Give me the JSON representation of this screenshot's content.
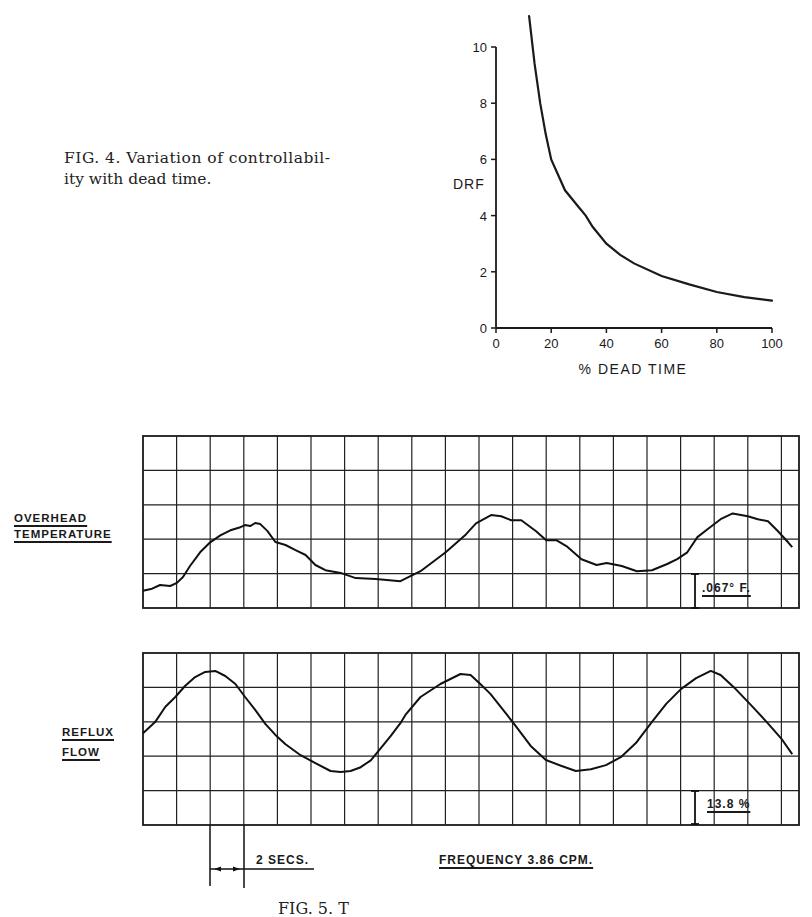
{
  "figure4": {
    "caption_line1": "FIG. 4.  Variation of controllabil-",
    "caption_line2": "ity with dead time."
  },
  "chart_data": [
    {
      "type": "line",
      "title": "FIG. 4. Variation of controllability with dead time.",
      "xlabel": "% DEAD TIME",
      "ylabel": "DRF",
      "xlim": [
        0,
        100
      ],
      "ylim": [
        0,
        10
      ],
      "xticks": [
        "0",
        "20",
        "40",
        "60",
        "80",
        "100"
      ],
      "yticks": [
        "0",
        "2",
        "4",
        "6",
        "8",
        "10"
      ],
      "grid": false,
      "series": [
        {
          "name": "DRF vs dead time",
          "x": [
            12,
            14,
            16,
            18,
            20,
            25,
            30,
            32.5,
            35,
            40,
            45,
            50,
            60,
            70,
            80,
            90,
            100
          ],
          "y": [
            11.1,
            9.4,
            8.0,
            6.9,
            6.0,
            4.9,
            4.3,
            4.0,
            3.6,
            3.0,
            2.6,
            2.3,
            1.85,
            1.55,
            1.28,
            1.1,
            0.97
          ]
        }
      ]
    },
    {
      "type": "line",
      "title": "Recorder traces (FIG. 5)",
      "grid": true,
      "grid_columns": 19.5,
      "grid_rows": 5,
      "time_per_division": "2 SECS.",
      "frequency_label": "FREQUENCY  3.86 CPM.",
      "series": [
        {
          "name": "OVERHEAD TEMPERATURE",
          "scale_label": ".067° F.",
          "scale_per_division": ".067° F.",
          "x_div": [
            0,
            0.27,
            0.51,
            0.81,
            1.01,
            1.19,
            1.4,
            1.7,
            2.0,
            2.3,
            2.6,
            2.9,
            3.04,
            3.19,
            3.34,
            3.49,
            3.7,
            3.94,
            4.24,
            4.54,
            4.84,
            5.13,
            5.43,
            5.88,
            6.33,
            6.93,
            7.66,
            8.26,
            9.01,
            9.61,
            9.91,
            10.36,
            10.66,
            10.96,
            11.26,
            11.7,
            12.0,
            12.3,
            12.6,
            13.05,
            13.5,
            13.8,
            14.25,
            14.7,
            15.15,
            15.6,
            15.9,
            16.2,
            16.5,
            16.8,
            17.19,
            17.55,
            18.0,
            18.3,
            18.6,
            18.9,
            19.2,
            19.32
          ],
          "y_div": [
            0.5,
            0.56,
            0.67,
            0.64,
            0.73,
            0.9,
            1.22,
            1.62,
            1.91,
            2.11,
            2.26,
            2.35,
            2.41,
            2.38,
            2.47,
            2.44,
            2.24,
            1.92,
            1.83,
            1.68,
            1.54,
            1.25,
            1.1,
            1.02,
            0.87,
            0.84,
            0.78,
            1.07,
            1.62,
            2.14,
            2.46,
            2.7,
            2.67,
            2.55,
            2.55,
            2.23,
            1.97,
            1.97,
            1.8,
            1.42,
            1.25,
            1.31,
            1.22,
            1.07,
            1.1,
            1.28,
            1.42,
            1.62,
            2.06,
            2.29,
            2.58,
            2.75,
            2.67,
            2.58,
            2.52,
            2.23,
            1.91,
            1.77
          ]
        },
        {
          "name": "REFLUX FLOW",
          "scale_label": "13.8 %",
          "scale_per_division": "13.8 %",
          "x_div": [
            0,
            0.36,
            0.66,
            0.96,
            1.25,
            1.55,
            1.85,
            2.15,
            2.45,
            2.75,
            3.04,
            3.34,
            3.64,
            3.94,
            4.24,
            4.69,
            5.13,
            5.58,
            5.88,
            6.18,
            6.48,
            6.78,
            7.07,
            7.37,
            7.66,
            7.81,
            8.26,
            8.85,
            9.45,
            9.75,
            10.04,
            10.34,
            10.79,
            11.09,
            11.54,
            11.99,
            12.44,
            12.88,
            13.33,
            13.78,
            14.22,
            14.67,
            15.12,
            15.57,
            16.01,
            16.46,
            16.9,
            17.19,
            17.64,
            18.09,
            18.54,
            18.99,
            19.32
          ],
          "y_div": [
            2.67,
            2.99,
            3.43,
            3.72,
            4.04,
            4.3,
            4.45,
            4.48,
            4.33,
            4.1,
            3.72,
            3.35,
            2.94,
            2.62,
            2.35,
            2.03,
            1.8,
            1.57,
            1.54,
            1.57,
            1.68,
            1.88,
            2.23,
            2.58,
            2.96,
            3.2,
            3.72,
            4.1,
            4.39,
            4.36,
            4.1,
            3.81,
            3.26,
            2.88,
            2.3,
            1.89,
            1.72,
            1.57,
            1.62,
            1.74,
            1.97,
            2.38,
            2.96,
            3.52,
            3.95,
            4.27,
            4.48,
            4.36,
            3.95,
            3.49,
            3.02,
            2.52,
            2.06
          ]
        }
      ]
    }
  ],
  "figure5": {
    "row1_label_line1": "OVERHEAD",
    "row1_label_line2": "TEMPERATURE",
    "row2_label_line1": "REFLUX",
    "row2_label_line2": "FLOW",
    "scale1": ".067° F.",
    "scale2": "13.8 %",
    "time_marker": "2 SECS.",
    "frequency": "FREQUENCY  3.86 CPM.",
    "caption_partial": "FIG. 5.  T"
  }
}
